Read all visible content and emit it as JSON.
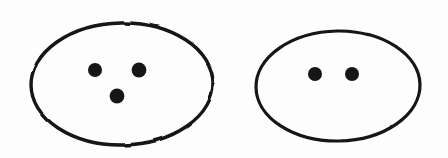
{
  "figure": {
    "type": "hand-drawn-diagram",
    "background_color": "#fdfdfd",
    "stroke_color": "#121212",
    "dot_color": "#141414",
    "canvas": {
      "width": 448,
      "height": 158
    },
    "groups": [
      {
        "name": "left-group",
        "label": "three-dot-set",
        "dot_count": 3,
        "ellipse": {
          "cx": 122,
          "cy": 84,
          "rx": 91,
          "ry": 61,
          "stroke_width": 3.4,
          "rotation": -1
        },
        "dots": [
          {
            "name": "left-dot-upper-left",
            "cx": 95,
            "cy": 70,
            "r": 7.0
          },
          {
            "name": "left-dot-upper-right",
            "cx": 139,
            "cy": 70,
            "r": 7.4
          },
          {
            "name": "left-dot-bottom",
            "cx": 117,
            "cy": 96,
            "r": 7.4
          }
        ]
      },
      {
        "name": "right-group",
        "label": "two-dot-set",
        "dot_count": 2,
        "ellipse": {
          "cx": 338,
          "cy": 86,
          "rx": 82,
          "ry": 55,
          "stroke_width": 3.2,
          "rotation": -1
        },
        "dots": [
          {
            "name": "right-dot-left",
            "cx": 315,
            "cy": 74,
            "r": 7.0
          },
          {
            "name": "right-dot-right",
            "cx": 352,
            "cy": 74,
            "r": 7.0
          }
        ]
      }
    ]
  }
}
